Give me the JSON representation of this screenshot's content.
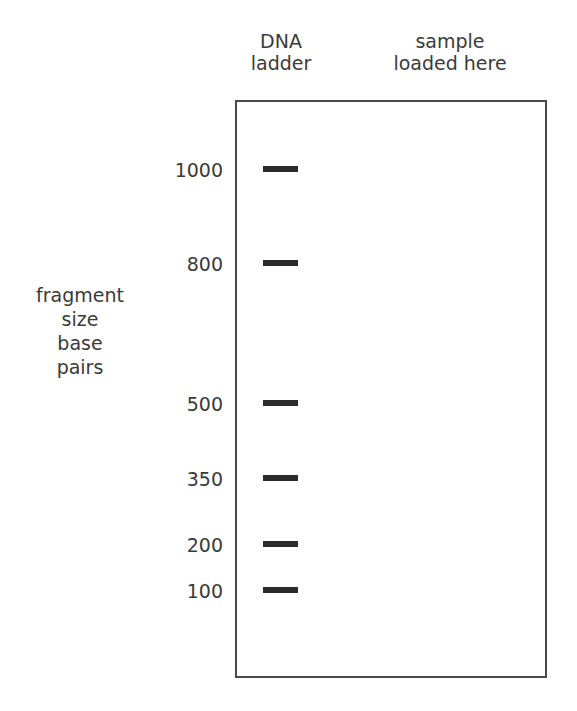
{
  "lanes": {
    "ladder": {
      "line1": "DNA",
      "line2": "ladder"
    },
    "sample": {
      "line1": "sample",
      "line2": "loaded here"
    }
  },
  "axis_title": [
    "fragment",
    "size",
    "base",
    "pairs"
  ],
  "bands": [
    {
      "label": "1000",
      "y": 169
    },
    {
      "label": "800",
      "y": 263
    },
    {
      "label": "500",
      "y": 403
    },
    {
      "label": "350",
      "y": 478
    },
    {
      "label": "200",
      "y": 544
    },
    {
      "label": "100",
      "y": 590
    }
  ],
  "colors": {
    "band": "#2b2b2b",
    "border": "#4a4a4a",
    "text": "#3a3a3a"
  }
}
